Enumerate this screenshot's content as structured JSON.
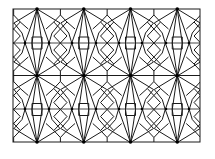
{
  "image": {
    "description": "Geometric star-and-polygon line tessellation pattern",
    "background": "#ffffff",
    "stroke_color": "#1a1a1a",
    "frame": {
      "x": 13,
      "y": 9,
      "width": 187,
      "height": 133
    },
    "tile": {
      "width": 46.75,
      "height": 66.5
    },
    "star_centers_x": [
      37,
      83,
      130,
      177
    ],
    "star_rows_y": [
      9,
      76,
      142
    ]
  }
}
